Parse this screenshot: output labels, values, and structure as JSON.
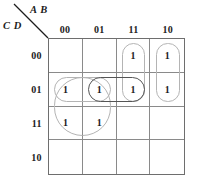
{
  "header": {
    "top_vars": "A B",
    "side_vars": "C D",
    "diagonal_icon": "diagonal-divider-icon"
  },
  "kmap": {
    "column_headers": [
      "00",
      "01",
      "11",
      "10"
    ],
    "row_headers": [
      "00",
      "01",
      "11",
      "10"
    ],
    "cells": [
      [
        "",
        "",
        "1",
        "1"
      ],
      [
        "1",
        "1",
        "1",
        "1"
      ],
      [
        "1",
        "1",
        "",
        ""
      ],
      [
        "",
        "",
        "",
        ""
      ]
    ],
    "groups": [
      {
        "name": "group-col11-rows00-01",
        "style": "light",
        "col_start": 2,
        "col_span": 1,
        "row_start": 0,
        "row_span": 2
      },
      {
        "name": "group-col10-rows00-01",
        "style": "light",
        "col_start": 3,
        "col_span": 1,
        "row_start": 0,
        "row_span": 2
      },
      {
        "name": "group-cols00-01-rows01-11",
        "style": "light",
        "col_start": 0,
        "col_span": 2,
        "row_start": 1,
        "row_span": 2
      },
      {
        "name": "group-row01-cols00-01",
        "style": "light",
        "col_start": 0,
        "col_span": 2,
        "row_start": 1,
        "row_span": 1
      },
      {
        "name": "group-row01-cols01-11",
        "style": "dark",
        "col_start": 1,
        "col_span": 2,
        "row_start": 1,
        "row_span": 1
      }
    ]
  },
  "colors": {
    "grid_line": "#8a8a8a",
    "grid_border": "#6e6e6e",
    "loop_light": "#b4b4b4",
    "loop_dark": "#555555",
    "text": "#1c1c1c",
    "background": "#ffffff"
  }
}
